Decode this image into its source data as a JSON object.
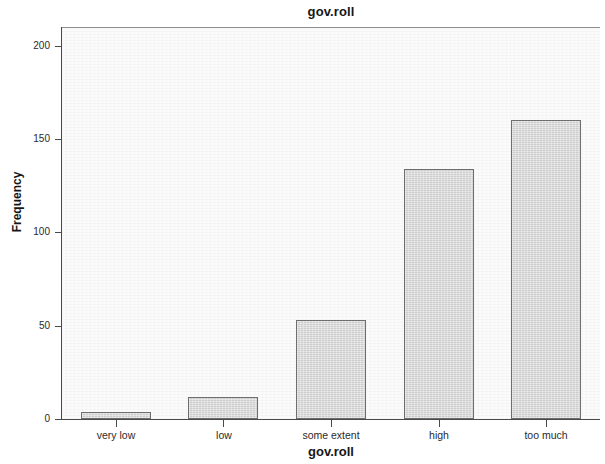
{
  "chart_data": {
    "type": "bar",
    "title": "gov.roll",
    "xlabel": "gov.roll",
    "ylabel": "Frequency",
    "categories": [
      "very low",
      "low",
      "some extent",
      "high",
      "too much"
    ],
    "values": [
      4,
      12,
      53,
      134,
      160
    ],
    "ylim": [
      0,
      210
    ],
    "yticks": [
      0,
      50,
      100,
      150,
      200
    ],
    "ytick_labels": [
      "0",
      "50",
      "100",
      "150",
      "200"
    ],
    "grid": false,
    "legend": null,
    "bar_fill_color": "#d5d5d5",
    "bar_border_color": "#6e6e6e",
    "plot_background_color": "#fbfbfb",
    "axis_color": "#4a4a4a"
  }
}
